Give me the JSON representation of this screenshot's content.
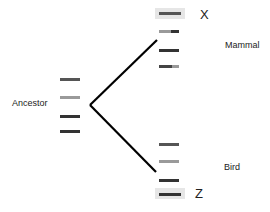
{
  "diagram": {
    "type": "phylogenetic-tree-with-gel-bands",
    "labels": {
      "ancestor": "Ancestor",
      "mammal": "Mammal",
      "bird": "Bird",
      "x": "X",
      "z": "Z"
    },
    "colors": {
      "dark_band": "#333333",
      "mid_band": "#555555",
      "light_band": "#9a9a9a",
      "highlight_box": "#e6e6e6",
      "branch_line": "#000000"
    },
    "ancestor_bands": [
      {
        "y": 79,
        "shade": "mid"
      },
      {
        "y": 97,
        "shade": "light"
      },
      {
        "y": 116,
        "shade": "dark"
      },
      {
        "y": 131,
        "shade": "dark"
      }
    ],
    "mammal_bands": [
      {
        "y": 13,
        "shade": "mid",
        "boxed": true,
        "marker": "X"
      },
      {
        "y": 31,
        "shade": "light-dark"
      },
      {
        "y": 50,
        "shade": "dark"
      },
      {
        "y": 66,
        "shade": "mid-light"
      }
    ],
    "bird_bands": [
      {
        "y": 144,
        "shade": "mid"
      },
      {
        "y": 161,
        "shade": "light"
      },
      {
        "y": 180,
        "shade": "dark"
      },
      {
        "y": 194,
        "shade": "dark",
        "boxed": true,
        "marker": "Z"
      }
    ],
    "branches": [
      {
        "from": [
          90,
          105
        ],
        "to": [
          157,
          40
        ]
      },
      {
        "from": [
          90,
          105
        ],
        "to": [
          156,
          172
        ]
      }
    ]
  }
}
